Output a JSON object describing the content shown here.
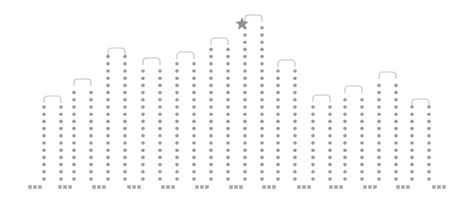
{
  "chart_data": {
    "type": "bar",
    "title": "",
    "xlabel": "",
    "ylabel": "",
    "style": "dotted loop columns",
    "categories": [
      "1",
      "2",
      "3",
      "4",
      "5",
      "6",
      "7",
      "8",
      "9",
      "10",
      "11",
      "12"
    ],
    "values": [
      91,
      108,
      139,
      129,
      135,
      149,
      172,
      127,
      92,
      101,
      115,
      88
    ],
    "highlight_index": 6,
    "highlight_marker": "star-icon",
    "ylim": [
      0,
      180
    ],
    "grid": false,
    "legend": null
  },
  "layout": {
    "baseline_y": 187,
    "loop_left_x": [
      44,
      74,
      108,
      143,
      177,
      211,
      245,
      278,
      313,
      345,
      379,
      412
    ],
    "loop_width": 17,
    "dot_color": "#9a9a9a",
    "arc_color": "#c4c4c4",
    "star_color": "#8f8f8f"
  }
}
